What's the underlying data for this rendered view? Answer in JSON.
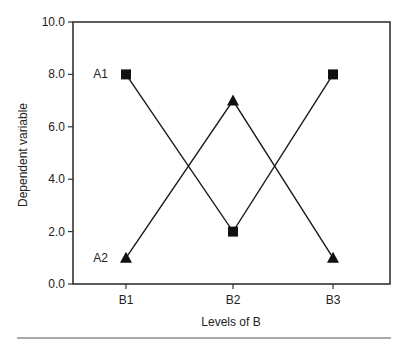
{
  "chart_data": {
    "type": "line",
    "title": "",
    "xlabel": "Levels of B",
    "ylabel": "Dependent variable",
    "categories": [
      "B1",
      "B2",
      "B3"
    ],
    "ylim": [
      0,
      10
    ],
    "yticks": [
      0,
      2,
      4,
      6,
      8,
      10
    ],
    "ytick_labels": [
      "0.0",
      "2.0",
      "4.0",
      "6.0",
      "8.0",
      "10.0"
    ],
    "grid": false,
    "legend": "inline-labels-left",
    "series": [
      {
        "name": "A1",
        "marker": "square",
        "values": [
          8.0,
          2.0,
          8.0
        ]
      },
      {
        "name": "A2",
        "marker": "triangle",
        "values": [
          1.0,
          7.0,
          1.0
        ]
      }
    ],
    "colors": {
      "line": "#1a1a1a",
      "marker": "#111111",
      "axis": "#333333",
      "rule": "#555555"
    }
  }
}
